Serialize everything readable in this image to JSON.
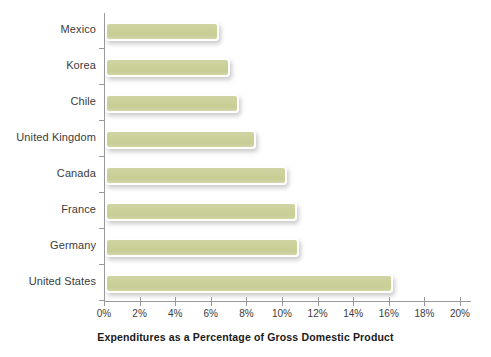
{
  "chart_data": {
    "type": "bar",
    "orientation": "horizontal",
    "title": "",
    "xlabel": "Expenditures as a Percentage of Gross Domestic Product",
    "ylabel": "",
    "categories": [
      "Mexico",
      "Korea",
      "Chile",
      "United Kingdom",
      "Canada",
      "France",
      "Germany",
      "United States"
    ],
    "values": [
      6.4,
      7.0,
      7.5,
      8.5,
      10.2,
      10.8,
      10.9,
      16.2
    ],
    "xlim": [
      0,
      20
    ],
    "xtick_labels": [
      "0%",
      "2%",
      "4%",
      "6%",
      "8%",
      "10%",
      "12%",
      "14%",
      "16%",
      "18%",
      "20%"
    ],
    "xtick_values": [
      0,
      2,
      4,
      6,
      8,
      10,
      12,
      14,
      16,
      18,
      20
    ],
    "grid": false,
    "legend": false,
    "bar_color": "#ccd19a",
    "axis_color": "#9a9a9a",
    "text_color": "#3c3c3c",
    "background": "#ffffff"
  }
}
